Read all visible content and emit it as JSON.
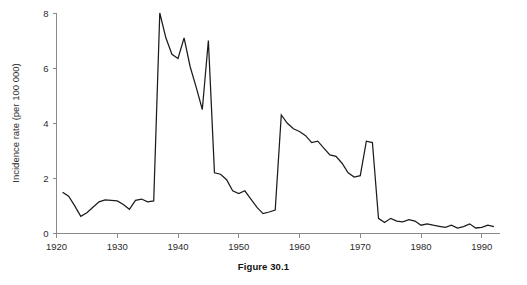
{
  "figure": {
    "caption": "Figure 30.1"
  },
  "chart_data": {
    "type": "line",
    "title": "",
    "xlabel": "",
    "ylabel": "Incidence rate (per 100 000)",
    "xlim": [
      1920,
      1993
    ],
    "ylim": [
      0,
      8
    ],
    "xticks": [
      1920,
      1930,
      1940,
      1950,
      1960,
      1970,
      1980,
      1990
    ],
    "xtick_labels": [
      "1920",
      "1930",
      "1940",
      "1950",
      "1960",
      "1970",
      "1980",
      "1990"
    ],
    "yticks": [
      0,
      2,
      4,
      6,
      8
    ],
    "ytick_labels": [
      "0",
      "2",
      "4",
      "6",
      "8"
    ],
    "grid": false,
    "legend": null,
    "line_color": "#1c1c1c",
    "background_color": "#ffffff",
    "axis_color": "#8a8a8a",
    "series": [
      {
        "name": "Incidence rate",
        "x": [
          1921,
          1922,
          1923,
          1924,
          1925,
          1926,
          1927,
          1928,
          1929,
          1930,
          1931,
          1932,
          1933,
          1934,
          1935,
          1936,
          1937,
          1938,
          1939,
          1940,
          1941,
          1942,
          1943,
          1944,
          1945,
          1946,
          1947,
          1948,
          1949,
          1950,
          1951,
          1952,
          1953,
          1954,
          1955,
          1956,
          1957,
          1958,
          1959,
          1960,
          1961,
          1962,
          1963,
          1964,
          1965,
          1966,
          1967,
          1968,
          1969,
          1970,
          1971,
          1972,
          1973,
          1974,
          1975,
          1976,
          1977,
          1978,
          1979,
          1980,
          1981,
          1982,
          1983,
          1984,
          1985,
          1986,
          1987,
          1988,
          1989,
          1990,
          1991,
          1992
        ],
        "values": [
          1.5,
          1.35,
          1.0,
          0.62,
          0.75,
          0.95,
          1.15,
          1.22,
          1.2,
          1.18,
          1.05,
          0.88,
          1.2,
          1.25,
          1.15,
          1.18,
          8.0,
          7.1,
          6.5,
          6.35,
          7.1,
          6.05,
          5.3,
          4.5,
          7.0,
          2.2,
          2.15,
          1.95,
          1.55,
          1.45,
          1.55,
          1.25,
          0.95,
          0.72,
          0.78,
          0.85,
          4.3,
          4.0,
          3.8,
          3.7,
          3.55,
          3.3,
          3.35,
          3.1,
          2.85,
          2.8,
          2.55,
          2.2,
          2.05,
          2.1,
          3.35,
          3.3,
          0.55,
          0.4,
          0.55,
          0.45,
          0.42,
          0.5,
          0.45,
          0.3,
          0.35,
          0.3,
          0.26,
          0.22,
          0.3,
          0.2,
          0.25,
          0.35,
          0.2,
          0.22,
          0.3,
          0.25
        ]
      }
    ]
  }
}
